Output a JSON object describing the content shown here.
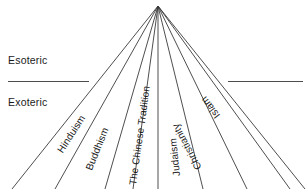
{
  "diagram": {
    "type": "radial-fan",
    "title_visible": false,
    "background_color": "#ffffff",
    "line_color": "#3a3a3a",
    "text_color": "#1b1b1b",
    "apex": {
      "x": 158,
      "y": 6
    },
    "tiers": [
      {
        "id": "esoteric",
        "label": "Esoteric",
        "position": "above-divider"
      },
      {
        "id": "exoteric",
        "label": "Exoteric",
        "position": "below-divider"
      }
    ],
    "divider": {
      "y": 81,
      "left_segment": {
        "x1": 8,
        "x2": 89
      },
      "right_segment": {
        "x1": 228,
        "x2": 303
      }
    },
    "traditions": [
      {
        "id": "hinduism",
        "label": "Hinduism",
        "ray_index": 1,
        "bottom_x": 55,
        "angle_deg": -57
      },
      {
        "id": "buddhism",
        "label": "Buddhism",
        "ray_index": 2,
        "bottom_x": 105,
        "angle_deg": -68
      },
      {
        "id": "chinese-tradition",
        "label": "The Chinese Tradition",
        "ray_index": 3,
        "bottom_x": 133,
        "angle_deg": -82
      },
      {
        "id": "judaism",
        "label": "Judaism",
        "ray_index": 5,
        "bottom_x": 203,
        "angle_deg": -96
      },
      {
        "id": "christianity",
        "label": "Christianity",
        "ray_index": 6,
        "bottom_x": 247,
        "angle_deg": -118
      },
      {
        "id": "islam",
        "label": "Islam",
        "ray_index": 7,
        "bottom_x": 290,
        "angle_deg": -127
      }
    ],
    "rays": [
      {
        "id": "ray-outer-left",
        "bottom_x": 12
      },
      {
        "id": "ray-hinduism",
        "bottom_x": 55
      },
      {
        "id": "ray-buddhism",
        "bottom_x": 105
      },
      {
        "id": "ray-chinese",
        "bottom_x": 133
      },
      {
        "id": "ray-center",
        "bottom_x": 158
      },
      {
        "id": "ray-judaism",
        "bottom_x": 203
      },
      {
        "id": "ray-christianity",
        "bottom_x": 247
      },
      {
        "id": "ray-islam",
        "bottom_x": 290
      },
      {
        "id": "ray-outer-right",
        "bottom_x": 305
      }
    ]
  }
}
